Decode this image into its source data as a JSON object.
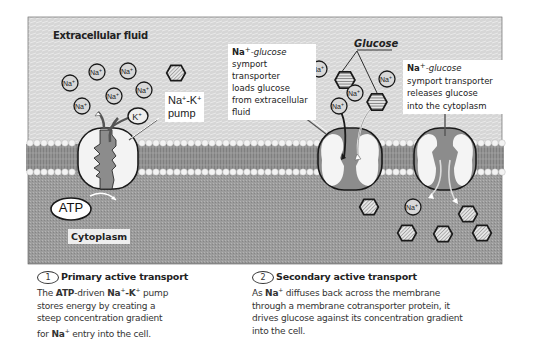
{
  "diagram": {
    "regions": {
      "extracellular": "Extracellular fluid",
      "cytoplasm": "Cytoplasm"
    },
    "molecules": {
      "sodium": "Na",
      "sodium_sup": "+",
      "potassium": "K",
      "potassium_sup": "+",
      "atp": "ATP"
    },
    "labels": {
      "pump_line1": "Na",
      "pump_sup1": "+",
      "pump_mid": "-K",
      "pump_sup2": "+",
      "pump_line2": "pump",
      "glucose": "Glucose",
      "symport_load": {
        "prefix": "Na",
        "sup": "+",
        "line1_rest": "-glucose",
        "lines": [
          "symport",
          "transporter",
          "loads glucose",
          "from extracellular",
          "fluid"
        ]
      },
      "symport_release": {
        "prefix": "Na",
        "sup": "+",
        "line1_rest": "-glucose",
        "lines": [
          "symport transporter",
          "releases glucose",
          "into the cytoplasm"
        ]
      }
    },
    "captions": [
      {
        "number": "1",
        "heading": "Primary active transport",
        "text_parts": [
          "The ",
          "ATP",
          "-driven ",
          "Na",
          "+",
          "-K",
          "+",
          " pump"
        ],
        "lines": [
          "stores energy by creating a",
          "steep concentration gradient"
        ],
        "last": [
          "for ",
          "Na",
          "+",
          " entry into the cell."
        ]
      },
      {
        "number": "2",
        "heading": "Secondary active transport",
        "first": [
          "As ",
          "Na",
          "+",
          " diffuses back across the membrane"
        ],
        "lines": [
          "through a membrane cotransporter protein, it",
          "drives glucose against its concentration gradient",
          "into the cell."
        ]
      }
    ],
    "colors": {
      "extracellular": "#d4d4d4",
      "cytoplasm": "#9a9a9a",
      "membrane_core": "#8a8a8a",
      "lipid_head": "#f2f2f2",
      "protein": "#f4f4f4",
      "channel": "#8c8c8c",
      "outline": "#1a1a1a"
    }
  }
}
